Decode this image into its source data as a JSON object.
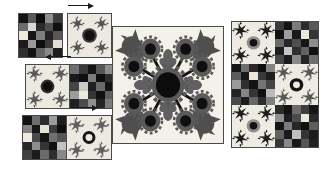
{
  "figure": {
    "palette": {
      "background": "#ffffff",
      "block_background": "#f2f0ec",
      "motif_dark": "#2b2b2b",
      "motif_mid": "#6e6e6e",
      "motif_light": "#b7b7b7",
      "border": "#4a4a4a",
      "arrow": "#1a1a1a",
      "center_black": "#101010"
    },
    "examples": [
      {
        "name": "example-row-1",
        "order": "noise-then-block",
        "arrow_direction": "right",
        "noise": {
          "name": "noise-grid-1",
          "cols": 5,
          "rows": 5,
          "cells": [
            "#141414",
            "#5a5a5a",
            "#0d0d0d",
            "#8f8f8f",
            "#3c3c3c",
            "#6b6b6b",
            "#d8d8d8",
            "#2a2a2a",
            "#4e4e4e",
            "#111111",
            "#efeade",
            "#161616",
            "#7d7d7d",
            "#232323",
            "#585858",
            "#1b1b1b",
            "#9a9a9a",
            "#0f0f0f",
            "#3a3a3a",
            "#e2ded2",
            "#2e2e2e",
            "#121212",
            "#646464",
            "#8a8a8a",
            "#1d1d1d"
          ]
        },
        "block": {
          "name": "quilt-block-1",
          "motif": "four-corner-fern-with-center-rosette",
          "background": "#ece9e1"
        }
      },
      {
        "name": "example-row-2",
        "order": "block-then-noise",
        "arrow_direction": "left",
        "noise": {
          "name": "noise-grid-2",
          "cols": 5,
          "rows": 5,
          "cells": [
            "#6f6f6f",
            "#3a3a3a",
            "#141414",
            "#565656",
            "#8d8d8d",
            "#1a1a1a",
            "#101010",
            "#7c7c7c",
            "#0e0e0e",
            "#2c2c2c",
            "#454545",
            "#c9c9c9",
            "#1f1f1f",
            "#6a6a6a",
            "#141414",
            "#9d9d9d",
            "#ece8dc",
            "#373737",
            "#111111",
            "#5e5e5e",
            "#202020",
            "#4c4c4c",
            "#8f8f8f",
            "#242424",
            "#7a7a7a"
          ]
        },
        "block": {
          "name": "quilt-block-2",
          "motif": "four-corner-fern-with-center-rosette",
          "background": "#ece9e1"
        }
      },
      {
        "name": "example-row-3",
        "order": "noise-then-block",
        "arrow_direction": "right",
        "noise": {
          "name": "noise-grid-3",
          "cols": 5,
          "rows": 5,
          "cells": [
            "#121212",
            "#6d6d6d",
            "#2a2a2a",
            "#9b9b9b",
            "#1e1e1e",
            "#828282",
            "#171717",
            "#e7e2d6",
            "#3d3d3d",
            "#0f0f0f",
            "#efeade",
            "#4a4a4a",
            "#151515",
            "#707070",
            "#555555",
            "#262626",
            "#8e8e8e",
            "#343434",
            "#101010",
            "#c2c2c2",
            "#3f3f3f",
            "#1c1c1c",
            "#6b6b6b",
            "#2d2d2d",
            "#878787"
          ]
        },
        "block": {
          "name": "quilt-block-3",
          "motif": "four-corner-fern-with-center-ring",
          "background": "#ece9e1"
        }
      }
    ],
    "center_block": {
      "name": "large-quilt-block",
      "motif": "radial-floral-medallion",
      "background": "#f4f1ea",
      "petal_count": 8,
      "tulip_count": 4,
      "leaf_count": 4,
      "description": "Central scalloped medallion with eight radiating stems ending in rosettes, four tulips on the diagonals and four oak leaves between"
    },
    "tiled_panel": {
      "name": "tiled-output-panel",
      "cols": 2,
      "rows": 3,
      "tiles": [
        {
          "name": "tile-0-0",
          "kind": "block",
          "motif": "four-corner-fern-with-center-rosette"
        },
        {
          "name": "tile-0-1",
          "kind": "noise",
          "cells": [
            "#3c3c3c",
            "#141414",
            "#7b7b7b",
            "#2b2b2b",
            "#585858",
            "#111111",
            "#9e9e9e",
            "#1a1a1a",
            "#ece7da",
            "#343434",
            "#6a6a6a",
            "#272727",
            "#4f4f4f",
            "#151515",
            "#8c8c8c",
            "#1d1d1d",
            "#c5c5c5",
            "#303030",
            "#636363",
            "#121212",
            "#474747",
            "#1b1b1b",
            "#8a8a8a",
            "#252525",
            "#6e6e6e"
          ]
        },
        {
          "name": "tile-1-0",
          "kind": "noise",
          "cells": [
            "#151515",
            "#6f6f6f",
            "#2a2a2a",
            "#0f0f0f",
            "#848484",
            "#5c5c5c",
            "#191919",
            "#ebe6d9",
            "#3a3a3a",
            "#1e1e1e",
            "#9a9a9a",
            "#2f2f2f",
            "#121212",
            "#747474",
            "#444444",
            "#232323",
            "#868686",
            "#353535",
            "#101010",
            "#b9b9b9",
            "#4a4a4a",
            "#1c1c1c",
            "#666666",
            "#2d2d2d",
            "#7f7f7f"
          ]
        },
        {
          "name": "tile-1-1",
          "kind": "block",
          "motif": "four-corner-fern-with-center-ring"
        },
        {
          "name": "tile-2-0",
          "kind": "block",
          "motif": "four-corner-fern-with-center-rosette"
        },
        {
          "name": "tile-2-1",
          "kind": "noise",
          "cells": [
            "#2b2b2b",
            "#121212",
            "#6c6c6c",
            "#3e3e3e",
            "#161616",
            "#8f8f8f",
            "#1f1f1f",
            "#4b4b4b",
            "#ece7da",
            "#2a2a2a",
            "#141414",
            "#7a7a7a",
            "#262626",
            "#101010",
            "#5d5d5d",
            "#626262",
            "#1a1a1a",
            "#c0c0c0",
            "#343434",
            "#1d1d1d",
            "#373737",
            "#898989",
            "#181818",
            "#565656",
            "#232323"
          ]
        }
      ]
    }
  }
}
